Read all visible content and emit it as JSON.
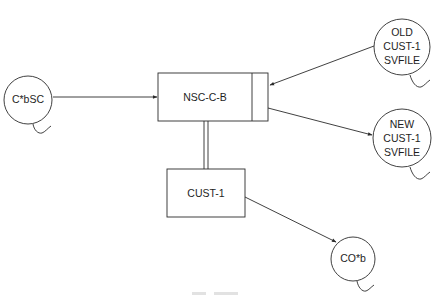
{
  "diagram": {
    "type": "data-flow",
    "processes": {
      "main": {
        "label": "NSC-C-B"
      },
      "sub": {
        "label": "CUST-1"
      }
    },
    "files": {
      "input": {
        "label": "C*bSC"
      },
      "old_file": {
        "line1": "OLD",
        "line2": "CUST-1",
        "line3": "SVFILE"
      },
      "new_file": {
        "line1": "NEW",
        "line2": "CUST-1",
        "line3": "SVFILE"
      },
      "output": {
        "label": "CO*b"
      }
    },
    "edges": [
      {
        "from": "C*bSC",
        "to": "NSC-C-B",
        "kind": "arrow"
      },
      {
        "from": "OLD CUST-1 SVFILE",
        "to": "NSC-C-B",
        "kind": "arrow"
      },
      {
        "from": "NSC-C-B",
        "to": "NEW CUST-1 SVFILE",
        "kind": "arrow"
      },
      {
        "from": "NSC-C-B",
        "to": "CUST-1",
        "kind": "double-line"
      },
      {
        "from": "CUST-1",
        "to": "CO*b",
        "kind": "arrow"
      }
    ],
    "colors": {
      "line": "#2b2b2b",
      "background": "#ffffff"
    }
  }
}
